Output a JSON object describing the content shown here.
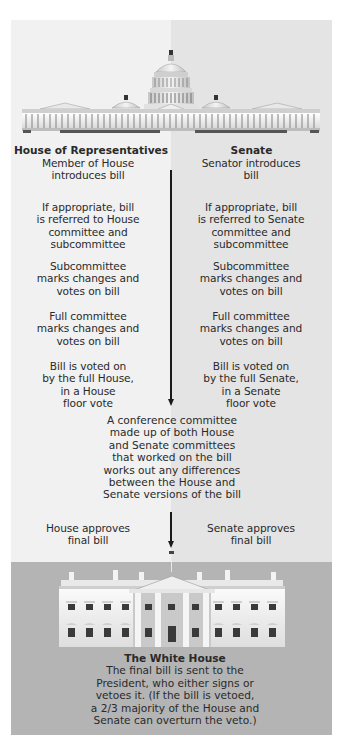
{
  "capitol": {
    "icon": "us-capitol-building-illustration"
  },
  "columns": {
    "house": {
      "header": "House of Representatives",
      "steps": [
        [
          "Member of House",
          "introduces bill"
        ],
        [
          "If appropriate, bill",
          "is referred to House",
          "committee and",
          "subcommittee"
        ],
        [
          "Subcommittee",
          "marks changes and",
          "votes on bill"
        ],
        [
          "Full committee",
          "marks changes and",
          "votes on bill"
        ],
        [
          "Bill is voted on",
          "by the full House,",
          "in a House",
          "floor vote"
        ]
      ],
      "approval": [
        "House approves",
        "final bill"
      ]
    },
    "senate": {
      "header": "Senate",
      "steps": [
        [
          "Senator introduces",
          "bill"
        ],
        [
          "If appropriate, bill",
          "is referred to Senate",
          "committee and",
          "subcommittee"
        ],
        [
          "Subcommittee",
          "marks changes and",
          "votes on bill"
        ],
        [
          "Full committee",
          "marks changes and",
          "votes on bill"
        ],
        [
          "Bill is voted on",
          "by the full Senate,",
          "in a Senate",
          "floor vote"
        ]
      ],
      "approval": [
        "Senate approves",
        "final bill"
      ]
    }
  },
  "conference": {
    "lines": [
      "A conference committee",
      "made up of both House",
      "and Senate committees",
      "that worked on the bill",
      "works out any differences",
      "between the House and",
      "Senate versions of the bill"
    ]
  },
  "white_house": {
    "icon": "white-house-building-illustration",
    "title": "The White House",
    "lines": [
      "The final bill is sent to the",
      "President, who either signs or",
      "vetoes it. (If the bill is vetoed,",
      "a 2/3 majority of the House and",
      "Senate can overturn the veto.)"
    ]
  },
  "colors": {
    "house_bg": "#f1f1f1",
    "senate_bg": "#e4e4e4",
    "white_house_bg": "#b4b4b4",
    "arrow": "#1a1a1a"
  }
}
